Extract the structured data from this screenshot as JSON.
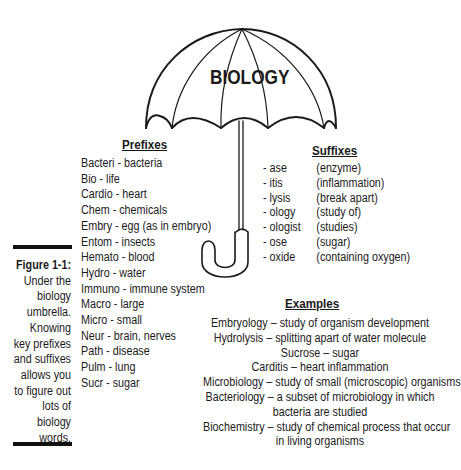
{
  "umbrella": {
    "title": "BIOLOGY"
  },
  "prefixes": {
    "heading": "Prefixes",
    "items": [
      "Bacteri - bacteria",
      "Bio - life",
      "Cardio - heart",
      "Chem - chemicals",
      "Embry - egg (as in embryo)",
      "Entom - insects",
      "Hemato - blood",
      "Hydro - water",
      "Immuno - immune system",
      "Macro - large",
      "Micro - small",
      "Neur - brain, nerves",
      "Path - disease",
      "Pulm - lung",
      "Sucr - sugar"
    ]
  },
  "suffixes": {
    "heading": "Suffixes",
    "items": [
      {
        "suffix": "- ase",
        "meaning": "(enzyme)"
      },
      {
        "suffix": "- itis",
        "meaning": "(inflammation)"
      },
      {
        "suffix": "- lysis",
        "meaning": "(break apart)"
      },
      {
        "suffix": "- ology",
        "meaning": "(study of)"
      },
      {
        "suffix": "- ologist",
        "meaning": "(studies)"
      },
      {
        "suffix": "- ose",
        "meaning": "(sugar)"
      },
      {
        "suffix": "- oxide",
        "meaning": "(containing oxygen)"
      }
    ]
  },
  "examples": {
    "heading": "Examples",
    "lines": [
      "Embryology – study of organism development",
      "Hydrolysis – splitting apart of water molecule",
      "Sucrose – sugar",
      "Carditis – heart inflammation",
      "Microbiology – study of small (microscopic) organisms",
      "Bacteriology – a subset of microbiology in which",
      "bacteria are studied",
      "Biochemistry – study of chemical process that occur",
      "in living organisms"
    ]
  },
  "caption": {
    "label": "Figure 1-1:",
    "lines": [
      "Under the",
      "biology",
      "umbrella.",
      "Knowing",
      "key prefixes",
      "and suffixes",
      "allows you",
      "to figure out",
      "lots of",
      "biology",
      "words."
    ]
  }
}
